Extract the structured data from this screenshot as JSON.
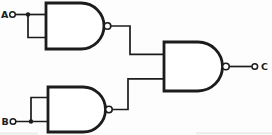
{
  "diagram": {
    "kind": "logic-circuit-schematic",
    "background": "#fdfdfd",
    "ink_color": "#1c1c1c",
    "inputs": [
      {
        "label": "A",
        "position": "top-left"
      },
      {
        "label": "B",
        "position": "bottom-left"
      }
    ],
    "output": {
      "label": "C",
      "position": "right"
    },
    "gates": [
      {
        "id": "gate-1",
        "type": "NAND",
        "inputs": [
          "A",
          "A"
        ],
        "role": "inverter"
      },
      {
        "id": "gate-2",
        "type": "NAND",
        "inputs": [
          "B",
          "B"
        ],
        "role": "inverter"
      },
      {
        "id": "gate-3",
        "type": "NAND",
        "inputs": [
          "gate-1-out",
          "gate-2-out"
        ],
        "output": "C"
      }
    ]
  }
}
